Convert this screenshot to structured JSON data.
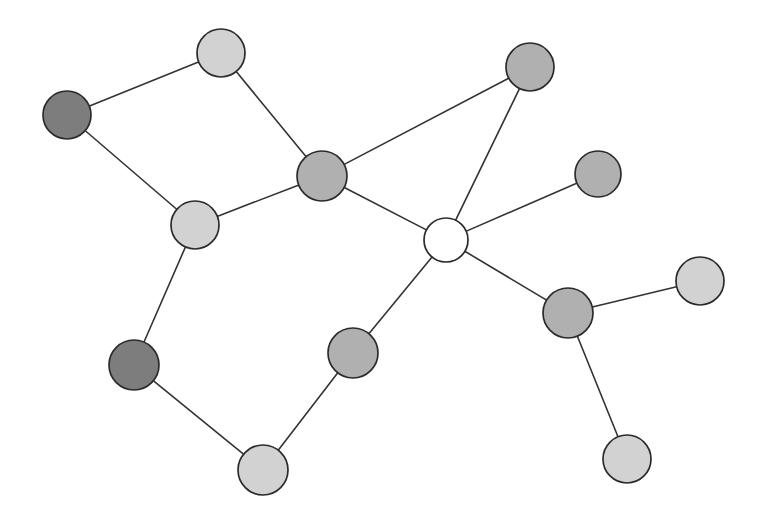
{
  "diagram": {
    "type": "node-link-diagram",
    "canvas": {
      "width": 760,
      "height": 516,
      "background": "#ffffff"
    },
    "palette": {
      "light_gray": "#d2d2d2",
      "medium_gray": "#b0b0b0",
      "dark_gray": "#7d7d7d",
      "white": "#ffffff",
      "node_stroke": "#2b2b2b",
      "edge_stroke": "#333333"
    },
    "node_count": 13,
    "edge_count": 15,
    "nodes": [
      {
        "id": "n1",
        "label": "n1",
        "cx": 221,
        "cy": 53,
        "r": 24,
        "fill": "#d2d2d2",
        "shade": "light_gray"
      },
      {
        "id": "n2",
        "label": "n2",
        "cx": 67,
        "cy": 115,
        "r": 24,
        "fill": "#7d7d7d",
        "shade": "dark_gray"
      },
      {
        "id": "n3",
        "label": "n3",
        "cx": 322,
        "cy": 176,
        "r": 25,
        "fill": "#b0b0b0",
        "shade": "medium_gray"
      },
      {
        "id": "n4",
        "label": "n4",
        "cx": 195,
        "cy": 225,
        "r": 24,
        "fill": "#d2d2d2",
        "shade": "light_gray"
      },
      {
        "id": "n5",
        "label": "n5",
        "cx": 530,
        "cy": 67,
        "r": 24,
        "fill": "#b0b0b0",
        "shade": "medium_gray"
      },
      {
        "id": "n6",
        "label": "n6",
        "cx": 446,
        "cy": 240,
        "r": 22,
        "fill": "#ffffff",
        "shade": "white"
      },
      {
        "id": "n7",
        "label": "n7",
        "cx": 598,
        "cy": 174,
        "r": 23,
        "fill": "#b0b0b0",
        "shade": "medium_gray"
      },
      {
        "id": "n8",
        "label": "n8",
        "cx": 700,
        "cy": 281,
        "r": 24,
        "fill": "#d2d2d2",
        "shade": "light_gray"
      },
      {
        "id": "n9",
        "label": "n9",
        "cx": 568,
        "cy": 313,
        "r": 25,
        "fill": "#b0b0b0",
        "shade": "medium_gray"
      },
      {
        "id": "n10",
        "label": "n10",
        "cx": 627,
        "cy": 459,
        "r": 24,
        "fill": "#d2d2d2",
        "shade": "light_gray"
      },
      {
        "id": "n11",
        "label": "n11",
        "cx": 353,
        "cy": 353,
        "r": 25,
        "fill": "#b0b0b0",
        "shade": "medium_gray"
      },
      {
        "id": "n12",
        "label": "n12",
        "cx": 134,
        "cy": 365,
        "r": 25,
        "fill": "#7d7d7d",
        "shade": "dark_gray"
      },
      {
        "id": "n13",
        "label": "n13",
        "cx": 263,
        "cy": 470,
        "r": 25,
        "fill": "#d2d2d2",
        "shade": "light_gray"
      }
    ],
    "edges": [
      {
        "source": "n1",
        "target": "n2"
      },
      {
        "source": "n1",
        "target": "n3"
      },
      {
        "source": "n2",
        "target": "n4"
      },
      {
        "source": "n4",
        "target": "n3"
      },
      {
        "source": "n4",
        "target": "n12"
      },
      {
        "source": "n3",
        "target": "n5"
      },
      {
        "source": "n3",
        "target": "n6"
      },
      {
        "source": "n5",
        "target": "n6"
      },
      {
        "source": "n6",
        "target": "n7"
      },
      {
        "source": "n6",
        "target": "n9"
      },
      {
        "source": "n6",
        "target": "n11"
      },
      {
        "source": "n9",
        "target": "n8"
      },
      {
        "source": "n9",
        "target": "n10"
      },
      {
        "source": "n12",
        "target": "n13"
      },
      {
        "source": "n13",
        "target": "n11"
      }
    ]
  }
}
